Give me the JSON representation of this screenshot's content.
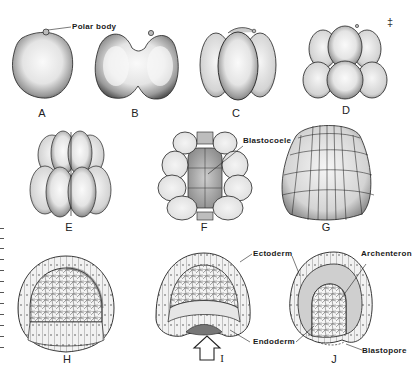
{
  "figure": {
    "panels": [
      {
        "id": "A",
        "label": "A",
        "stage": "zygote"
      },
      {
        "id": "B",
        "label": "B",
        "stage": "2-cell"
      },
      {
        "id": "C",
        "label": "C",
        "stage": "4-cell"
      },
      {
        "id": "D",
        "label": "D",
        "stage": "8-cell"
      },
      {
        "id": "E",
        "label": "E",
        "stage": "16-cell"
      },
      {
        "id": "F",
        "label": "F",
        "stage": "32-cell section"
      },
      {
        "id": "G",
        "label": "G",
        "stage": "blastula"
      },
      {
        "id": "H",
        "label": "H",
        "stage": "blastula section"
      },
      {
        "id": "I",
        "label": "I",
        "stage": "early gastrula"
      },
      {
        "id": "J",
        "label": "J",
        "stage": "gastrula"
      }
    ],
    "callouts": {
      "polar_body": "Polar body",
      "blastocoele": "Blastocoele",
      "ectoderm": "Ectoderm",
      "archenteron": "Archenteron",
      "endoderm": "Endoderm",
      "blastopore": "Blastopore"
    },
    "corner_mark": "‡",
    "colors": {
      "ink": "#1a1a1a",
      "stipple_dark": "#6a6a6a",
      "stipple_light": "#d8d8d8",
      "paper": "#ffffff"
    }
  }
}
